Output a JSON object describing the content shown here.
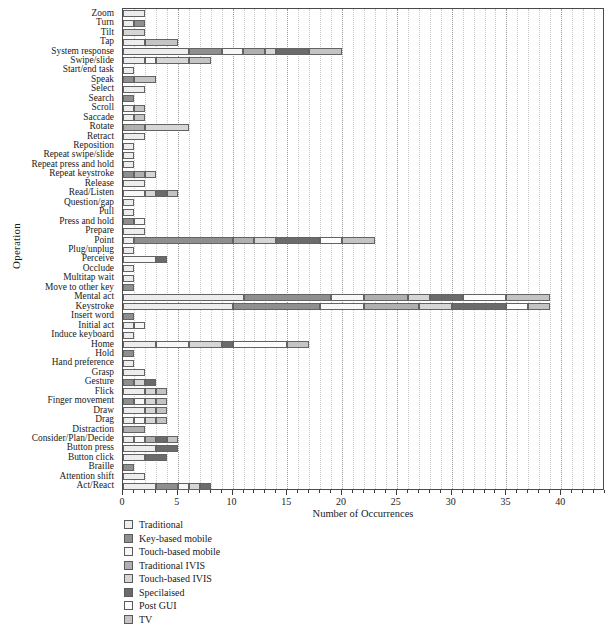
{
  "chart_data": {
    "type": "bar",
    "orientation": "horizontal",
    "stacked": true,
    "title": "",
    "xlabel": "Number of Occurrences",
    "ylabel": "Operation",
    "xlim": [
      0,
      44
    ],
    "xticks": [
      0,
      5,
      10,
      15,
      20,
      25,
      30,
      35,
      40
    ],
    "grid": true,
    "legend_position": "below-left",
    "series": [
      {
        "name": "Traditional",
        "color": "#ededed"
      },
      {
        "name": "Key-based mobile",
        "color": "#8f8f8f"
      },
      {
        "name": "Touch-based mobile",
        "color": "#f7f7f7"
      },
      {
        "name": "Traditional IVIS",
        "color": "#b0b0b0"
      },
      {
        "name": "Touch-based IVIS",
        "color": "#d6d6d6"
      },
      {
        "name": "Specilaised",
        "color": "#6b6b6b"
      },
      {
        "name": "Post GUI",
        "color": "#fcfcfc"
      },
      {
        "name": "TV",
        "color": "#c4c4c4"
      }
    ],
    "categories": [
      "Zoom",
      "Turn",
      "Tilt",
      "Tap",
      "System response",
      "Swipe/slide",
      "Start/end task",
      "Speak",
      "Select",
      "Search",
      "Scroll",
      "Saccade",
      "Rotate",
      "Retract",
      "Reposition",
      "Repeat swipe/slide",
      "Repeat press and hold",
      "Repeat keystroke",
      "Release",
      "Read/Listen",
      "Question/gap",
      "Pull",
      "Press and hold",
      "Prepare",
      "Point",
      "Plug/unplug",
      "Perceive",
      "Occlude",
      "Multitap wait",
      "Move to other key",
      "Mental act",
      "Keystroke",
      "Insert word",
      "Initial act",
      "Induce keyboard",
      "Home",
      "Hold",
      "Hand preference",
      "Grasp",
      "Gesture",
      "Flick",
      "Finger movement",
      "Draw",
      "Drag",
      "Distraction",
      "Consider/Plan/Decide",
      "Button press",
      "Button click",
      "Braille",
      "Attention shift",
      "Act/React"
    ],
    "values": [
      [
        2,
        0,
        0,
        0,
        0,
        0,
        0,
        0
      ],
      [
        1,
        1,
        0,
        0,
        0,
        0,
        0,
        0
      ],
      [
        0,
        0,
        0,
        0,
        2,
        0,
        0,
        0
      ],
      [
        2,
        0,
        0,
        0,
        0,
        0,
        0,
        3
      ],
      [
        6,
        3,
        2,
        2,
        1,
        3,
        0,
        3
      ],
      [
        2,
        0,
        1,
        0,
        3,
        0,
        0,
        2
      ],
      [
        1,
        0,
        0,
        0,
        0,
        0,
        0,
        0
      ],
      [
        0,
        1,
        0,
        0,
        0,
        0,
        0,
        2
      ],
      [
        2,
        0,
        0,
        0,
        0,
        0,
        0,
        0
      ],
      [
        0,
        1,
        0,
        0,
        0,
        0,
        0,
        0
      ],
      [
        1,
        0,
        0,
        0,
        0,
        0,
        0,
        1
      ],
      [
        1,
        0,
        0,
        0,
        0,
        0,
        0,
        1
      ],
      [
        0,
        0,
        0,
        2,
        4,
        0,
        0,
        0
      ],
      [
        2,
        0,
        0,
        0,
        0,
        0,
        0,
        0
      ],
      [
        1,
        0,
        0,
        0,
        0,
        0,
        0,
        0
      ],
      [
        1,
        0,
        0,
        0,
        0,
        0,
        0,
        0
      ],
      [
        1,
        0,
        0,
        0,
        0,
        0,
        0,
        0
      ],
      [
        0,
        1,
        0,
        1,
        1,
        0,
        0,
        0
      ],
      [
        2,
        0,
        0,
        0,
        0,
        0,
        0,
        0
      ],
      [
        0,
        0,
        2,
        0,
        1,
        1,
        0,
        1
      ],
      [
        1,
        0,
        0,
        0,
        0,
        0,
        0,
        0
      ],
      [
        1,
        0,
        0,
        0,
        0,
        0,
        0,
        0
      ],
      [
        0,
        1,
        1,
        0,
        0,
        0,
        0,
        0
      ],
      [
        2,
        0,
        0,
        0,
        0,
        0,
        0,
        0
      ],
      [
        1,
        9,
        0,
        2,
        2,
        4,
        2,
        3
      ],
      [
        1,
        0,
        0,
        0,
        0,
        0,
        0,
        0
      ],
      [
        0,
        0,
        3,
        0,
        0,
        1,
        0,
        0
      ],
      [
        1,
        0,
        0,
        0,
        0,
        0,
        0,
        0
      ],
      [
        1,
        0,
        0,
        0,
        0,
        0,
        0,
        0
      ],
      [
        0,
        1,
        0,
        0,
        0,
        0,
        0,
        0
      ],
      [
        11,
        8,
        3,
        4,
        2,
        3,
        4,
        4
      ],
      [
        10,
        8,
        4,
        5,
        3,
        5,
        2,
        2
      ],
      [
        0,
        1,
        0,
        0,
        0,
        0,
        0,
        0
      ],
      [
        1,
        0,
        1,
        0,
        0,
        0,
        0,
        0
      ],
      [
        1,
        0,
        0,
        0,
        0,
        0,
        0,
        0
      ],
      [
        3,
        0,
        3,
        0,
        3,
        1,
        5,
        2
      ],
      [
        0,
        1,
        0,
        0,
        0,
        0,
        0,
        0
      ],
      [
        1,
        0,
        0,
        0,
        0,
        0,
        0,
        0
      ],
      [
        2,
        0,
        0,
        0,
        0,
        0,
        0,
        0
      ],
      [
        0,
        1,
        0,
        0,
        1,
        1,
        0,
        0
      ],
      [
        2,
        0,
        0,
        0,
        1,
        0,
        0,
        1
      ],
      [
        0,
        1,
        1,
        0,
        1,
        0,
        0,
        1
      ],
      [
        2,
        0,
        0,
        0,
        1,
        0,
        0,
        1
      ],
      [
        1,
        0,
        1,
        0,
        1,
        0,
        0,
        1
      ],
      [
        0,
        0,
        0,
        2,
        0,
        0,
        0,
        0
      ],
      [
        1,
        0,
        1,
        1,
        0,
        1,
        0,
        1
      ],
      [
        3,
        0,
        0,
        0,
        0,
        2,
        0,
        0
      ],
      [
        2,
        0,
        0,
        0,
        0,
        2,
        0,
        0
      ],
      [
        0,
        1,
        0,
        0,
        0,
        0,
        0,
        0
      ],
      [
        2,
        0,
        0,
        0,
        0,
        0,
        0,
        0
      ],
      [
        3,
        2,
        1,
        0,
        1,
        1,
        0,
        0
      ]
    ]
  }
}
